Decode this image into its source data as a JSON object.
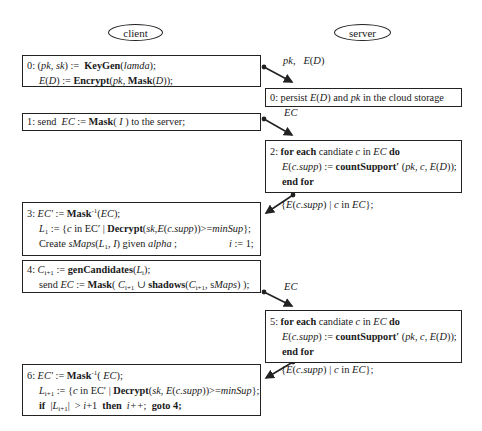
{
  "actors": {
    "client": "client",
    "server": "server"
  },
  "steps": {
    "client_0": {
      "line1": {
        "prefix": "0: (",
        "pk": "pk",
        "comma": ", ",
        "sk": "sk",
        "assign": ") :=  ",
        "fn": "KeyGen",
        "open": "(",
        "arg": "lamda",
        "close": ");"
      },
      "line2": {
        "E": "E",
        "D": "D",
        "assign": ") := ",
        "fn": "Encrypt",
        "open": "(",
        "pk": "pk",
        "sep": ", ",
        "fn2": "Mask",
        "open2": "(",
        "D2": "D",
        "close": "));"
      }
    },
    "server_0": {
      "prefix": "0: persist ",
      "E": "E",
      "D": "D",
      "mid": ") and ",
      "pk": "pk",
      "suffix": " in the cloud storage"
    },
    "client_1": {
      "prefix": "1: send  ",
      "EC": "EC",
      "assign": " := ",
      "fn": "Mask",
      "open": "( ",
      "I": "I",
      "suffix": " ) to the server;"
    },
    "server_2": {
      "line1": {
        "prefix": "2: ",
        "kw1": "for each",
        "mid": " candiate ",
        "c": "c",
        "in": " in ",
        "EC": "EC",
        "kw2": " do"
      },
      "line2": {
        "E": "E",
        "csupp": "c.supp",
        "assign": ") := ",
        "fn": "countSupport′",
        "args_open": " (",
        "pk": "pk",
        "sep1": ", ",
        "c": "c",
        "sep2": ", ",
        "E2": "E",
        "D": "D",
        "close": "));"
      },
      "line3": {
        "kw": "end for"
      }
    },
    "client_3": {
      "line1": {
        "prefix": "3: ",
        "ECp": "EC′",
        "assign": " := ",
        "fn": "Mask",
        "sup": "-1",
        "open": "(",
        "EC": "EC",
        "close": ");"
      },
      "line2": {
        "L": "L",
        "sub": "1",
        "assign": " := {",
        "c": "c",
        "in": " in EC′ | ",
        "fn": "Decrypt",
        "open": "(",
        "sk": "sk",
        "sep": ",",
        "E": "E",
        "csupp": "c.supp",
        "close": "))>=",
        "minSup": "minSup",
        "end": "};"
      },
      "line3": {
        "prefix": "Create ",
        "sMaps": "sMaps",
        "open": "(",
        "L": "L",
        "sub": "1",
        "sep": ", ",
        "I": "I",
        "close": ") given ",
        "alpha": "alpha",
        "semi": " ;",
        "i": "i",
        "init": " := 1;"
      }
    },
    "client_4": {
      "line1": {
        "prefix": "4: ",
        "C": "C",
        "sub": "i+1",
        "assign": " := ",
        "fn": "genCandidates",
        "open": "(",
        "L": "L",
        "lsub": "i",
        "close": ");"
      },
      "line2": {
        "prefix": "send ",
        "EC": "EC",
        "assign": " := ",
        "fn": "Mask",
        "open": "( ",
        "C": "C",
        "sub": "i+1",
        "union": " ∪ ",
        "fn2": "shadows",
        "open2": "(",
        "C2": "C",
        "sub2": "i+1",
        "sep": ", s",
        "Maps": "Maps",
        "close": ") );"
      }
    },
    "server_5": {
      "line1": {
        "prefix": "5: ",
        "kw1": "for each",
        "mid": " candiate ",
        "c": "c",
        "in": " in ",
        "EC": "EC",
        "kw2": " do"
      },
      "line2": {
        "E": "E",
        "csupp": "c.supp",
        "assign": ") := ",
        "fn": "countSupport′",
        "args_open": " (",
        "pk": "pk",
        "sep1": ", ",
        "c": "c",
        "sep2": ", ",
        "E2": "E",
        "D": "D",
        "close": "));"
      },
      "line3": {
        "kw": "end for"
      }
    },
    "client_6": {
      "line1": {
        "prefix": "6: ",
        "ECp": "EC′",
        "assign": " := ",
        "fn": "Mask",
        "sup": "-1",
        "open": "( ",
        "EC": "EC",
        "close": ");"
      },
      "line2": {
        "L": "L",
        "sub": "i+1",
        "assign": " := {",
        "c": "c",
        "in": " in EC′ | ",
        "fn": "Decrypt",
        "open": "(",
        "sk": "sk",
        "sep": ", ",
        "E": "E",
        "csupp": "c.supp",
        "close": "))>=",
        "minSup": "minSup",
        "end": "};"
      },
      "line3": {
        "kw_if": "if",
        "bar_open": "  |",
        "L": "L",
        "sub": "i+1",
        "bar_close": "|",
        "gt": "  > ",
        "i": "i",
        "plus": "+1  ",
        "kw_then": "then",
        "sp": "  ",
        "iinc": "i++",
        "semi": ";  ",
        "kw_goto": "goto 4;"
      }
    }
  },
  "messages": {
    "m0": {
      "pk": "pk",
      "sep": ",   ",
      "E": "E",
      "D": "D"
    },
    "m1": {
      "EC": "EC"
    },
    "m2": {
      "open": "{",
      "E": "E",
      "csupp": "c.supp",
      "mid": ") | ",
      "c": "c",
      "in": " in ",
      "EC": "EC",
      "close": "};"
    },
    "m3": {
      "EC": "EC"
    },
    "m4": {
      "open": "{",
      "E": "E",
      "csupp": "c.supp",
      "mid": ") | ",
      "c": "c",
      "in": " in ",
      "EC": "EC",
      "close": "};"
    }
  }
}
